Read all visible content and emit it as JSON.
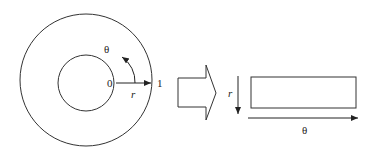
{
  "diagram": {
    "annulus": {
      "center_label": "0",
      "outer_label": "1",
      "radial_label": "r",
      "angular_label": "θ"
    },
    "transform_arrow": "block-arrow-right",
    "rectangle": {
      "vertical_axis_label": "r",
      "horizontal_axis_label": "θ"
    },
    "colors": {
      "stroke": "#333333",
      "background": "#ffffff"
    }
  }
}
